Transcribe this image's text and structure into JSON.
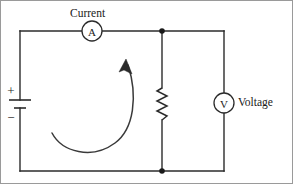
{
  "figure": {
    "type": "electrical-circuit-schematic",
    "width": 293,
    "height": 184,
    "background_color": "#ffffff",
    "line_color": "#2b2b2b",
    "border_color": "#9a9a9a"
  },
  "labels": {
    "current": "Current",
    "voltage": "Voltage"
  },
  "meters": {
    "ammeter": {
      "symbol": "A",
      "name": "ammeter",
      "label": "Current",
      "center_x": 92,
      "center_y": 31,
      "radius": 10
    },
    "voltmeter": {
      "symbol": "V",
      "name": "voltmeter",
      "label": "Voltage",
      "center_x": 224,
      "center_y": 103,
      "radius": 10
    }
  },
  "battery": {
    "name": "battery-cell",
    "positive_sign": "+",
    "negative_sign": "−",
    "x": 20,
    "positive_plate_y": 100,
    "negative_plate_y": 108
  },
  "resistor": {
    "name": "resistor",
    "x": 162,
    "top_y": 88,
    "bottom_y": 120,
    "zigzag_count": 6
  },
  "junctions": [
    {
      "name": "top-node",
      "x": 162,
      "y": 31
    },
    {
      "name": "bottom-node",
      "x": 162,
      "y": 171
    }
  ],
  "circuit_loop": {
    "left": 20,
    "right": 224,
    "top": 31,
    "bottom": 171
  },
  "current_arrow": {
    "name": "current-direction-arrow",
    "direction": "counterclockwise-sweep",
    "tail_x": 52,
    "tail_y": 133,
    "head_x": 127,
    "head_y": 61
  }
}
